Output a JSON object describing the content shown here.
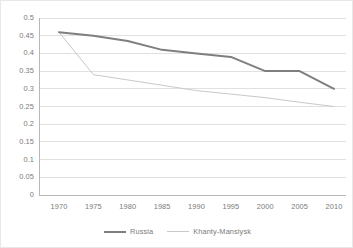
{
  "chart_data": {
    "type": "line",
    "title": "",
    "xlabel": "",
    "ylabel": "",
    "categories": [
      1970,
      1975,
      1980,
      1985,
      1990,
      1995,
      2000,
      2005,
      2010
    ],
    "x_tick_labels": [
      "1970",
      "1975",
      "1980",
      "1985",
      "1990",
      "1995",
      "2000",
      "2005",
      "2010"
    ],
    "y_tick_labels": [
      "0",
      "0.05",
      "0.1",
      "0.15",
      "0.2",
      "0.25",
      "0.3",
      "0.35",
      "0.4",
      "0.45",
      "0.5"
    ],
    "y_tick_values": [
      0,
      0.05,
      0.1,
      0.15,
      0.2,
      0.25,
      0.3,
      0.35,
      0.4,
      0.45,
      0.5
    ],
    "ylim": [
      0,
      0.5
    ],
    "xlim": [
      1970,
      2010
    ],
    "grid": "horizontal",
    "legend_position": "bottom",
    "series": [
      {
        "name": "Russia",
        "color": "#7f7f7f",
        "line_width": 2,
        "values": [
          0.46,
          0.45,
          0.435,
          0.41,
          0.4,
          0.39,
          0.35,
          0.35,
          0.3
        ]
      },
      {
        "name": "Khanty-Mansiysk",
        "color": "#c9c9c9",
        "line_width": 1,
        "values": [
          0.46,
          0.34,
          0.325,
          0.31,
          0.295,
          0.285,
          0.275,
          0.262,
          0.25
        ]
      }
    ]
  },
  "legend": {
    "items": [
      {
        "label": "Russia"
      },
      {
        "label": "Khanty-Mansiysk"
      }
    ]
  },
  "colors": {
    "russia": "#7f7f7f",
    "khanty": "#c9c9c9",
    "gridline": "#e0e0e0",
    "axis": "#b8b8b8",
    "tick_text": "#7a7a7a"
  }
}
